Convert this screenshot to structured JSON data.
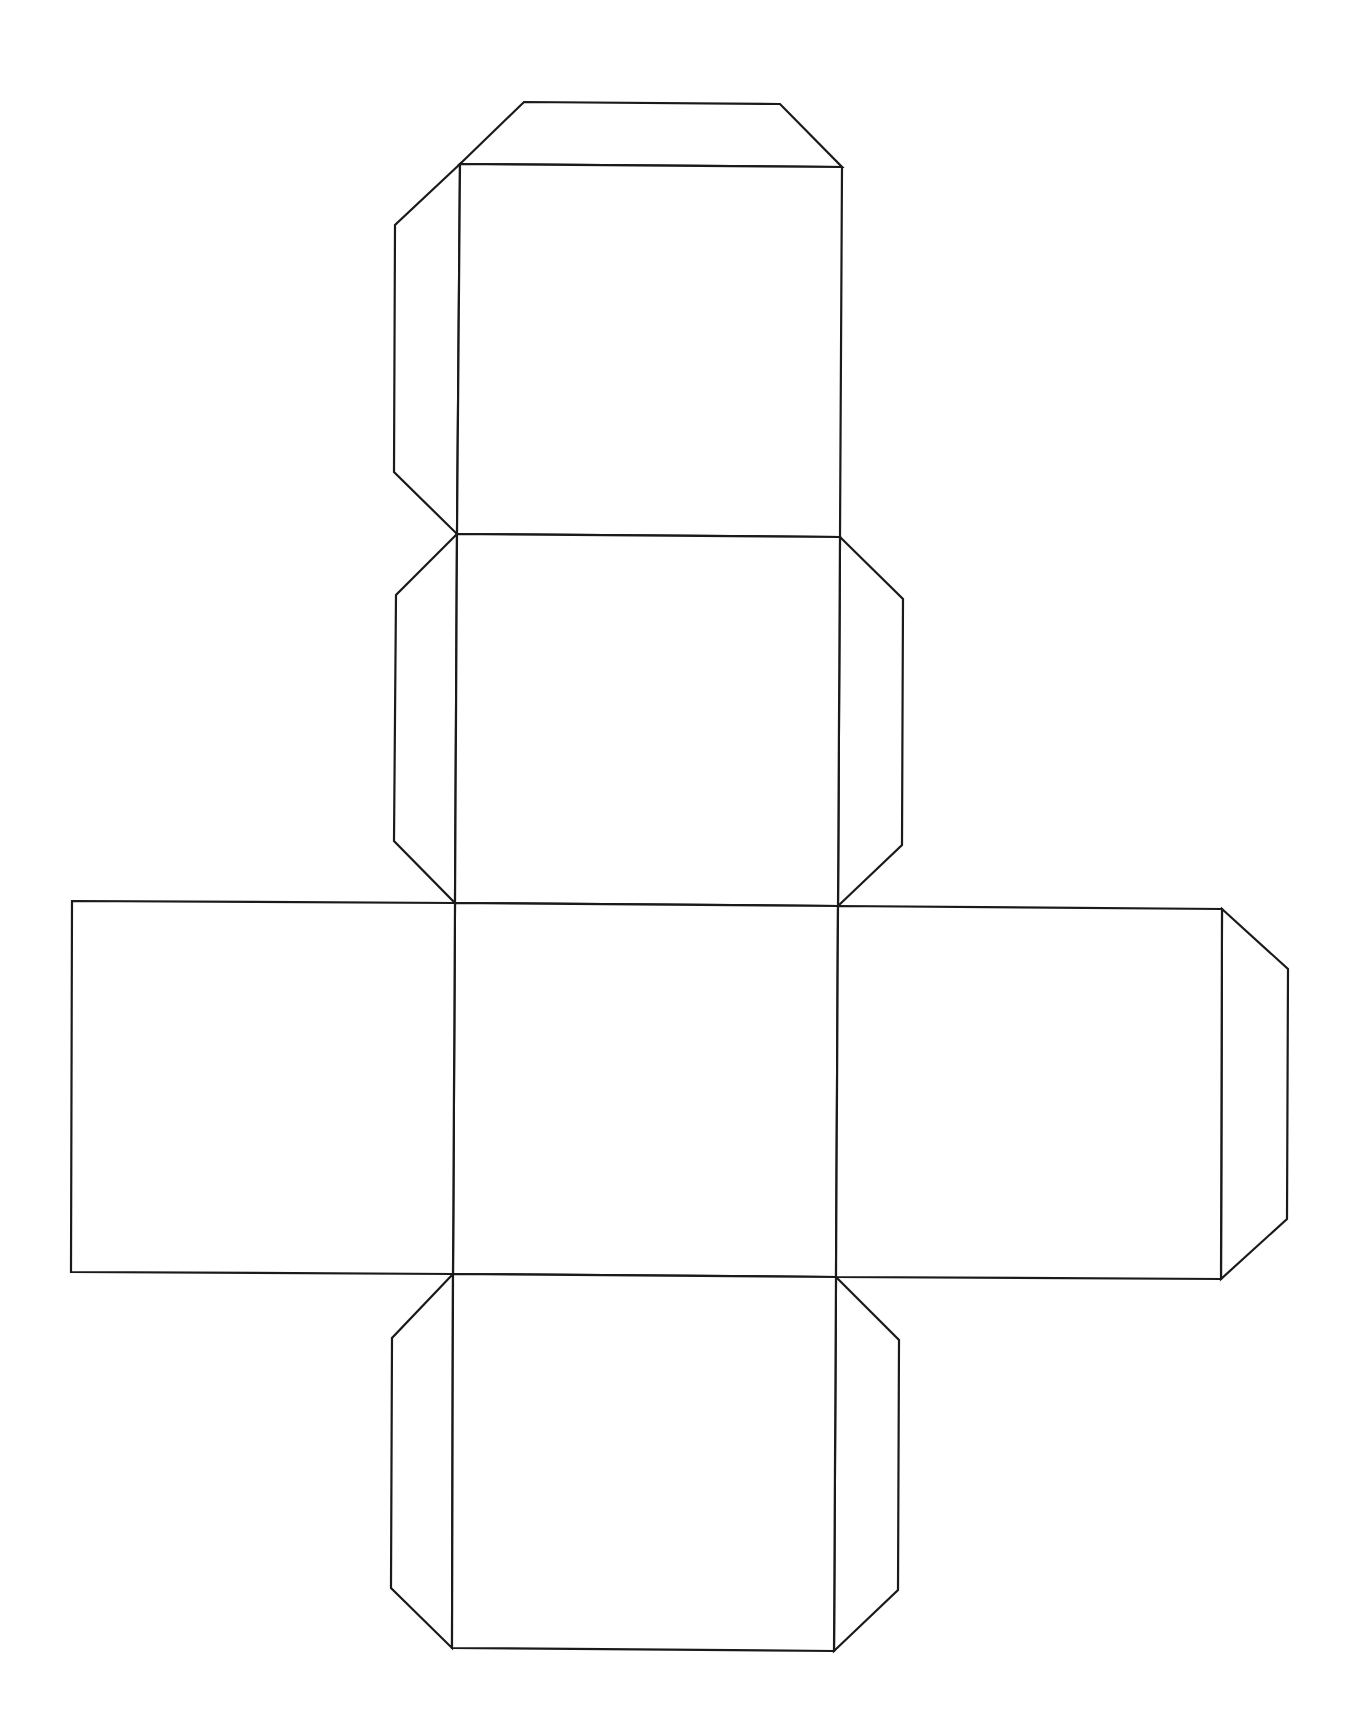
{
  "diagram": {
    "type": "cube-net",
    "stroke_color": "#1a1a1a",
    "background": "#ffffff",
    "faces": [
      {
        "name": "top-face",
        "points": [
          [
            460,
            164
          ],
          [
            842,
            167
          ],
          [
            840,
            537
          ],
          [
            457,
            534
          ]
        ]
      },
      {
        "name": "upper-face",
        "points": [
          [
            457,
            534
          ],
          [
            840,
            537
          ],
          [
            838,
            906
          ],
          [
            455,
            903
          ]
        ]
      },
      {
        "name": "center-face",
        "points": [
          [
            455,
            903
          ],
          [
            838,
            906
          ],
          [
            836,
            1277
          ],
          [
            453,
            1274
          ]
        ]
      },
      {
        "name": "left-face",
        "points": [
          [
            72,
            901
          ],
          [
            455,
            903
          ],
          [
            453,
            1274
          ],
          [
            71,
            1272
          ]
        ]
      },
      {
        "name": "right-face",
        "points": [
          [
            838,
            906
          ],
          [
            1222,
            909
          ],
          [
            1221,
            1279
          ],
          [
            836,
            1277
          ]
        ]
      },
      {
        "name": "bottom-face",
        "points": [
          [
            453,
            1274
          ],
          [
            836,
            1277
          ],
          [
            834,
            1651
          ],
          [
            452,
            1648
          ]
        ]
      }
    ],
    "tabs": [
      {
        "name": "top-tab",
        "points": [
          [
            460,
            164
          ],
          [
            524,
            102
          ],
          [
            780,
            104
          ],
          [
            842,
            167
          ]
        ]
      },
      {
        "name": "top-left-tab",
        "points": [
          [
            460,
            164
          ],
          [
            395,
            225
          ],
          [
            394,
            472
          ],
          [
            457,
            534
          ]
        ]
      },
      {
        "name": "upper-left-tab",
        "points": [
          [
            457,
            534
          ],
          [
            396,
            595
          ],
          [
            394,
            841
          ],
          [
            455,
            903
          ]
        ]
      },
      {
        "name": "upper-right-tab",
        "points": [
          [
            840,
            537
          ],
          [
            903,
            599
          ],
          [
            902,
            845
          ],
          [
            838,
            906
          ]
        ]
      },
      {
        "name": "right-tab",
        "points": [
          [
            1222,
            909
          ],
          [
            1288,
            969
          ],
          [
            1287,
            1219
          ],
          [
            1221,
            1279
          ]
        ]
      },
      {
        "name": "bottom-left-tab",
        "points": [
          [
            453,
            1274
          ],
          [
            392,
            1338
          ],
          [
            391,
            1588
          ],
          [
            452,
            1648
          ]
        ]
      },
      {
        "name": "bottom-right-tab",
        "points": [
          [
            836,
            1277
          ],
          [
            899,
            1340
          ],
          [
            898,
            1590
          ],
          [
            834,
            1651
          ]
        ]
      }
    ]
  }
}
